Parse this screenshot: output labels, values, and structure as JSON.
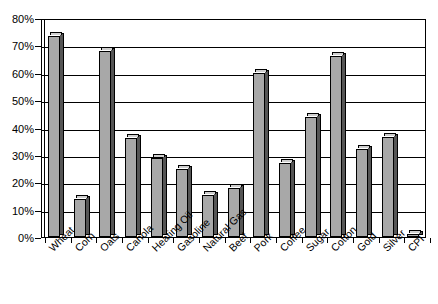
{
  "chart_data": {
    "type": "bar",
    "title": "",
    "subtitle": "",
    "xlabel": "",
    "ylabel": "",
    "ylim": [
      0,
      80
    ],
    "ytick_labels": [
      "0%",
      "10%",
      "20%",
      "30%",
      "40%",
      "50%",
      "60%",
      "70%",
      "80%"
    ],
    "ytick_values": [
      0,
      10,
      20,
      30,
      40,
      50,
      60,
      70,
      80
    ],
    "grid": true,
    "legend": "none",
    "categories": [
      "Wheat",
      "Corn",
      "Oats",
      "Canola",
      "Heating Oil",
      "Gasoline",
      "Natural Gas",
      "Beef",
      "Pork",
      "Coffee",
      "Sugar",
      "Cotton",
      "Gold",
      "Silver",
      "CPI"
    ],
    "values": [
      73.5,
      14,
      68,
      36,
      29,
      25,
      15.5,
      18,
      60,
      27,
      44,
      66,
      32,
      36.5,
      1
    ],
    "bar_color": "#a8a8a8",
    "bar_side_color": "#555555",
    "bar_top_color": "#cfcfcf",
    "bar_outline_color": "#000000",
    "axis_color": "#000000",
    "background_color": "#ffffff"
  }
}
